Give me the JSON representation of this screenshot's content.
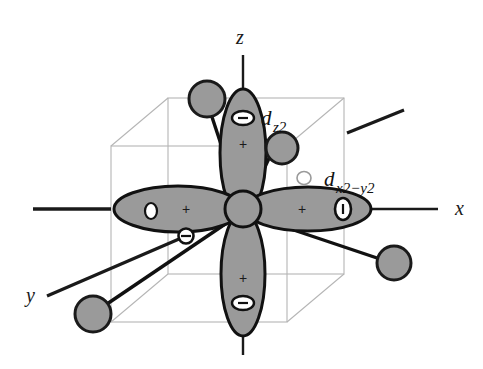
{
  "figure": {
    "background_color": "#ffffff",
    "width": 483,
    "height": 369
  },
  "colors": {
    "lobe_fill": "#9a9a9a",
    "lobe_stroke": "#111111",
    "ligand_fill": "#9a9a9a",
    "ligand_stroke": "#1a1a1a",
    "nucleus_fill": "#9a9a9a",
    "nucleus_stroke": "#111111",
    "cube_line": "#b5b5b5",
    "axis_line": "#1a1a1a",
    "bond_line": "#111111",
    "node_fill": "#ffffff",
    "text": "#111111"
  },
  "axes": [
    {
      "name": "z-axis",
      "label": "z",
      "label_x": 236,
      "label_y": 44
    },
    {
      "name": "x-axis",
      "label": "x",
      "label_x": 455,
      "label_y": 215
    },
    {
      "name": "y-axis",
      "label": "y",
      "label_x": 26,
      "label_y": 302
    }
  ],
  "orbitals": [
    {
      "name": "dz2-orbital",
      "label_main": "d",
      "label_sub": "z2",
      "label_x": 264,
      "label_y": 125,
      "orientation": "vertical",
      "lobes": [
        {
          "name": "dz2-upper-lobe",
          "sign": "+",
          "node_marker": "minus-node"
        },
        {
          "name": "dz2-lower-lobe",
          "sign": "+",
          "node_marker": "minus-node"
        }
      ]
    },
    {
      "name": "dx2-y2-orbital",
      "label_main": "d",
      "label_sub": "x2−y2",
      "label_x": 327,
      "label_y": 186,
      "orientation": "horizontal",
      "lobes": [
        {
          "name": "dx2-y2-right-lobe",
          "sign": "+",
          "node_marker": "minus-node"
        },
        {
          "name": "dx2-y2-left-lobe",
          "sign": "+",
          "node_marker": "minus-node"
        }
      ]
    }
  ],
  "signs": {
    "plus": "+",
    "minus": "−"
  },
  "ligands": [
    {
      "name": "ligand-upper-left",
      "cx": 207,
      "cy": 99,
      "r": 18
    },
    {
      "name": "ligand-upper-right",
      "cx": 282,
      "cy": 148,
      "r": 16
    },
    {
      "name": "ligand-lower-left",
      "cx": 93,
      "cy": 314,
      "r": 18
    },
    {
      "name": "ligand-lower-right",
      "cx": 394,
      "cy": 263,
      "r": 17
    }
  ],
  "nucleus": {
    "name": "central-metal-atom",
    "cx": 243,
    "cy": 209,
    "r": 18
  },
  "bond_nodes": [
    {
      "name": "bond-node-front",
      "cx": 186,
      "cy": 236,
      "rx": 7,
      "ry": 7,
      "style": "dark"
    },
    {
      "name": "bond-node-back",
      "cx": 304,
      "cy": 178,
      "rx": 7,
      "ry": 6,
      "style": "faint"
    }
  ],
  "cube": {
    "name": "cubic-ligand-field-box",
    "front_face": {
      "x": 111,
      "y": 146,
      "w": 176,
      "h": 176
    },
    "back_face": {
      "x": 168,
      "y": 98,
      "w": 176,
      "h": 176
    }
  }
}
